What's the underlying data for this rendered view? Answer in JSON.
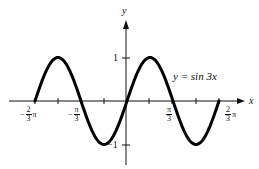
{
  "chart_data": {
    "type": "line",
    "title": "",
    "equation_label": "y = sin 3x",
    "xlabel": "x",
    "ylabel": "y",
    "function": "sin(3x)",
    "xlim": [
      -2.0944,
      2.0944
    ],
    "ylim": [
      -1,
      1
    ],
    "x_ticks": [
      {
        "value": -2.0944,
        "label": "-2/3 π"
      },
      {
        "value": -1.5708,
        "label": ""
      },
      {
        "value": -1.0472,
        "label": "-π/3"
      },
      {
        "value": -0.5236,
        "label": ""
      },
      {
        "value": 0.5236,
        "label": ""
      },
      {
        "value": 1.0472,
        "label": "π/3"
      },
      {
        "value": 1.5708,
        "label": ""
      },
      {
        "value": 2.0944,
        "label": "2/3 π"
      }
    ],
    "y_ticks": [
      {
        "value": 1,
        "label": "1"
      },
      {
        "value": -1,
        "label": "-1"
      }
    ],
    "x": [
      -2.0944,
      -1.5708,
      -1.0472,
      -0.5236,
      0,
      0.5236,
      1.0472,
      1.5708,
      2.0944
    ],
    "series": [
      {
        "name": "y = sin 3x",
        "values": [
          0,
          1,
          0,
          -1,
          0,
          1,
          0,
          -1,
          0
        ]
      }
    ],
    "grid": false,
    "legend": "none"
  },
  "labels": {
    "y_axis": "y",
    "x_axis": "x",
    "equation": "y = sin 3x",
    "y_one": "1",
    "y_neg_one": "−1",
    "neg_two_thirds_sign": "−",
    "neg_two_thirds_num": "2",
    "neg_two_thirds_den": "3",
    "neg_two_thirds_pi": "π",
    "neg_third_sign": "−",
    "neg_third_num": "π",
    "neg_third_den": "3",
    "third_num": "π",
    "third_den": "3",
    "two_thirds_num": "2",
    "two_thirds_den": "3",
    "two_thirds_pi": "π"
  }
}
